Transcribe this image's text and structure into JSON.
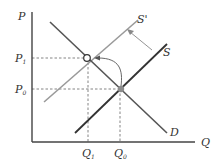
{
  "diagram": {
    "axes": {
      "y_label": "P",
      "x_label": "Q"
    },
    "price_levels": [
      {
        "label": "P",
        "subscript": "1"
      },
      {
        "label": "P",
        "subscript": "0"
      }
    ],
    "quantity_levels": [
      {
        "label": "Q",
        "subscript": "1"
      },
      {
        "label": "Q",
        "subscript": "0"
      }
    ],
    "curves": {
      "demand": "D",
      "supply": "S",
      "supply_shifted": "S'"
    },
    "colors": {
      "axis": "#444444",
      "demand": "#555555",
      "supply": "#333333",
      "supply_shifted": "#9a9a9a",
      "guides": "#777777",
      "arrow": "#777777",
      "initial_point": "#888888"
    }
  }
}
